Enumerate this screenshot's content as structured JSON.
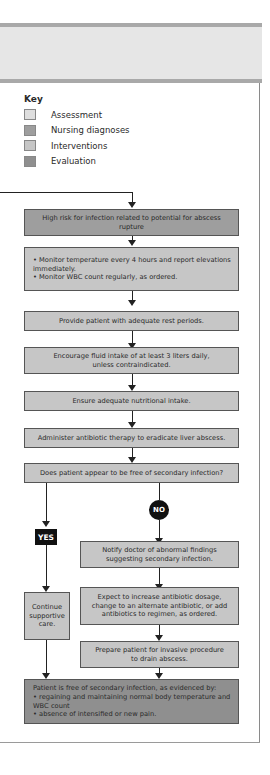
{
  "key": {
    "title": "Key",
    "items": [
      {
        "label": "Assessment",
        "color": "#dedede"
      },
      {
        "label": "Nursing diagnoses",
        "color": "#9e9e9e"
      },
      {
        "label": "Interventions",
        "color": "#c6c6c6"
      },
      {
        "label": "Evaluation",
        "color": "#8f8f8f"
      }
    ]
  },
  "flow": {
    "diagnosis": "High risk for infection related to potential for abscess rupture",
    "monitor": {
      "bullets": [
        "• Monitor temperature every 4 hours and report elevations immediately.",
        "• Monitor WBC count regularly, as ordered."
      ]
    },
    "rest": "Provide patient with adequate rest periods.",
    "fluid": "Encourage fluid intake of at least 3 liters daily, unless contraindicated.",
    "nutrition": "Ensure adequate nutritional intake.",
    "antibiotic": "Administer antibiotic therapy to eradicate liver abscess.",
    "question": "Does patient appear to be free of secondary infection?",
    "yes_label": "YES",
    "no_label": "NO",
    "continue": "Continue supportive care.",
    "notify": "Notify doctor of abnormal findings suggesting secondary infection.",
    "expect": "Expect to increase antibiotic dosage, change to an alternate antibiotic, or add antibiotics to regimen, as ordered.",
    "prepare": "Prepare patient for invasive procedure to drain abscess.",
    "evaluation": {
      "intro": "Patient is free of secondary infection, as evidenced by:",
      "bullets": [
        "• regaining and maintaining normal body temperature and WBC count",
        "• absence of intensified or new pain."
      ]
    }
  }
}
